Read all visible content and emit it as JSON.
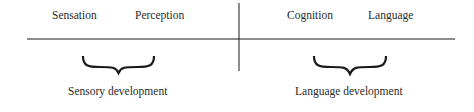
{
  "quadrants": {
    "top_left": [
      "Sensation",
      "Perception"
    ],
    "top_right": [
      "Cognition",
      "Language"
    ]
  },
  "groups": [
    {
      "label": "Sensory development"
    },
    {
      "label": "Language development"
    }
  ],
  "colors": {
    "line": "#1a1a1a",
    "text": "#2a2a2a"
  }
}
